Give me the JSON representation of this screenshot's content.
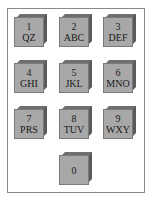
{
  "keypad": {
    "keys": [
      {
        "digit": "1",
        "letters": "QZ"
      },
      {
        "digit": "2",
        "letters": "ABC"
      },
      {
        "digit": "3",
        "letters": "DEF"
      },
      {
        "digit": "4",
        "letters": "GHI"
      },
      {
        "digit": "5",
        "letters": "JKL"
      },
      {
        "digit": "6",
        "letters": "MNO"
      },
      {
        "digit": "7",
        "letters": "PRS"
      },
      {
        "digit": "8",
        "letters": "TUV"
      },
      {
        "digit": "9",
        "letters": "WXY"
      },
      {
        "digit": "0",
        "letters": ""
      }
    ],
    "colors": {
      "key_face": "#a8a8a8",
      "key_bevel": "#5a5a5a",
      "frame_border": "#8a8a8a"
    }
  }
}
